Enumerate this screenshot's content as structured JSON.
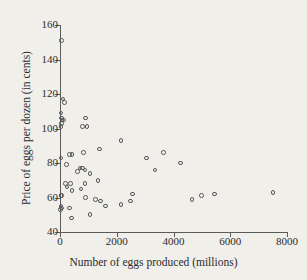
{
  "chart_data": {
    "type": "scatter",
    "title": "",
    "xlabel": "Number of eggs produced (millions)",
    "ylabel": "Price of eggs per dozen (in cents)",
    "xlim": [
      0,
      8000
    ],
    "ylim": [
      40,
      160
    ],
    "xticks": [
      0,
      2000,
      4000,
      6000,
      8000
    ],
    "yticks": [
      40,
      60,
      80,
      100,
      120,
      140,
      160
    ],
    "xtick_labels": [
      "0",
      "2000",
      "4000",
      "6000",
      "8000"
    ],
    "ytick_labels": [
      "40",
      "60",
      "80",
      "100",
      "120",
      "140",
      "160"
    ],
    "grid": false,
    "legend": "none",
    "marker": "open-circle",
    "marker_color": "#57565a",
    "points": [
      {
        "x": 60,
        "y": 151
      },
      {
        "x": 110,
        "y": 117
      },
      {
        "x": 150,
        "y": 115
      },
      {
        "x": 40,
        "y": 109
      },
      {
        "x": 55,
        "y": 106
      },
      {
        "x": 70,
        "y": 105
      },
      {
        "x": 130,
        "y": 105
      },
      {
        "x": 45,
        "y": 103
      },
      {
        "x": 35,
        "y": 101
      },
      {
        "x": 900,
        "y": 106
      },
      {
        "x": 790,
        "y": 101
      },
      {
        "x": 950,
        "y": 101
      },
      {
        "x": 2150,
        "y": 93
      },
      {
        "x": 1400,
        "y": 88
      },
      {
        "x": 820,
        "y": 86
      },
      {
        "x": 3650,
        "y": 86
      },
      {
        "x": 330,
        "y": 85
      },
      {
        "x": 420,
        "y": 85
      },
      {
        "x": 40,
        "y": 83
      },
      {
        "x": 3050,
        "y": 83
      },
      {
        "x": 4250,
        "y": 80
      },
      {
        "x": 230,
        "y": 79
      },
      {
        "x": 700,
        "y": 77
      },
      {
        "x": 800,
        "y": 77
      },
      {
        "x": 880,
        "y": 76
      },
      {
        "x": 3350,
        "y": 76
      },
      {
        "x": 620,
        "y": 75
      },
      {
        "x": 1060,
        "y": 74
      },
      {
        "x": 1340,
        "y": 70
      },
      {
        "x": 190,
        "y": 68
      },
      {
        "x": 370,
        "y": 68
      },
      {
        "x": 880,
        "y": 68
      },
      {
        "x": 250,
        "y": 66
      },
      {
        "x": 740,
        "y": 65
      },
      {
        "x": 430,
        "y": 64
      },
      {
        "x": 2550,
        "y": 62
      },
      {
        "x": 5450,
        "y": 62
      },
      {
        "x": 7500,
        "y": 63
      },
      {
        "x": 35,
        "y": 61
      },
      {
        "x": 55,
        "y": 61
      },
      {
        "x": 4980,
        "y": 61
      },
      {
        "x": 900,
        "y": 60
      },
      {
        "x": 1250,
        "y": 59
      },
      {
        "x": 4650,
        "y": 59
      },
      {
        "x": 1420,
        "y": 58
      },
      {
        "x": 2480,
        "y": 58
      },
      {
        "x": 2150,
        "y": 56
      },
      {
        "x": 1600,
        "y": 55
      },
      {
        "x": 30,
        "y": 55
      },
      {
        "x": 50,
        "y": 54
      },
      {
        "x": 330,
        "y": 54
      },
      {
        "x": 20,
        "y": 53
      },
      {
        "x": 1060,
        "y": 50
      },
      {
        "x": 400,
        "y": 48
      }
    ]
  }
}
